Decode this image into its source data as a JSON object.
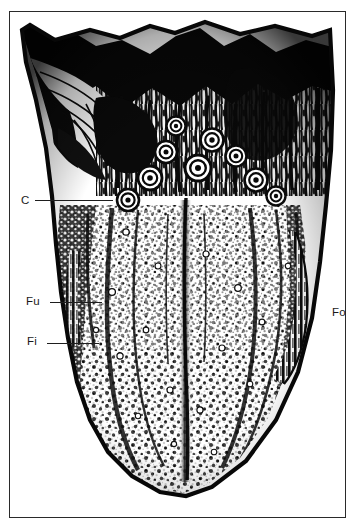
{
  "figure": {
    "kind": "anatomical-illustration",
    "rendering": "black-and-white halftone engraving",
    "background_color": "#ffffff",
    "ink_color": "#121212",
    "frame": {
      "present": true,
      "color": "#2a2a2a",
      "x": 9,
      "y": 11,
      "width": 337,
      "height": 507
    }
  },
  "labels": [
    {
      "id": "c",
      "text": "C",
      "meaning": "circumvallate papillae",
      "side": "left",
      "x": 21,
      "y": 194,
      "leader": {
        "x1": 35,
        "y1": 200,
        "x2": 113,
        "y2": 200
      }
    },
    {
      "id": "fu",
      "text": "Fu",
      "meaning": "fungiform papillae",
      "side": "left",
      "x": 26,
      "y": 295,
      "leader": {
        "x1": 50,
        "y1": 302,
        "x2": 102,
        "y2": 302
      }
    },
    {
      "id": "fi",
      "text": "Fi",
      "meaning": "filiform papillae",
      "side": "left",
      "x": 27,
      "y": 335,
      "leader": {
        "x1": 47,
        "y1": 343,
        "x2": 99,
        "y2": 343
      }
    },
    {
      "id": "fo",
      "text": "Fo",
      "meaning": "foliate papillae",
      "side": "right",
      "x": 332,
      "y": 306,
      "leader": null
    }
  ],
  "regions": [
    {
      "name": "root-of-tongue-dark-mass",
      "description": "dense black irregular mass along the upper border"
    },
    {
      "name": "lingual-tonsil-follicles",
      "description": "striated vertical follicular texture in the posterior third"
    },
    {
      "name": "epiglottic-vallecula-dissection",
      "description": "dark dissected folds at the upper left"
    },
    {
      "name": "circumvallate-papillae-row",
      "description": "V-shaped row of concentric ring papillae, apex pointing backward"
    },
    {
      "name": "median-sulcus",
      "description": "dark vertical groove down the middle of the body"
    },
    {
      "name": "filiform-fungiform-field",
      "description": "dense stippled papillary field over the anterior two thirds"
    },
    {
      "name": "foliate-ridges-right-margin",
      "description": "parallel vertical ridges on the right lateral margin"
    },
    {
      "name": "tongue-tip",
      "description": "rounded apex with heavy dark outline"
    }
  ]
}
